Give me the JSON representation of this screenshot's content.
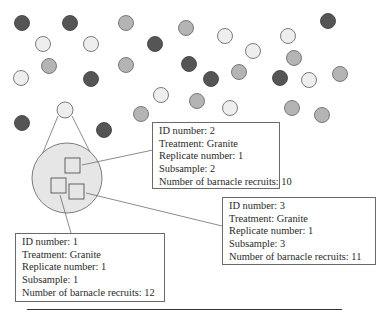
{
  "figure": {
    "colors": {
      "dark": "#555555",
      "mid": "#b4b4b4",
      "light": "#eeeeee",
      "stroke": "#6e6e6e",
      "plot_fill": "#e6e6e6"
    },
    "plots": [
      {
        "x": 22,
        "y": 23,
        "shade": "dark"
      },
      {
        "x": 70,
        "y": 23,
        "shade": "dark"
      },
      {
        "x": 126,
        "y": 23,
        "shade": "mid"
      },
      {
        "x": 186,
        "y": 28,
        "shade": "mid"
      },
      {
        "x": 328,
        "y": 21,
        "shade": "dark"
      },
      {
        "x": 43,
        "y": 44,
        "shade": "light"
      },
      {
        "x": 91,
        "y": 44,
        "shade": "light"
      },
      {
        "x": 155,
        "y": 44,
        "shade": "dark"
      },
      {
        "x": 225,
        "y": 36,
        "shade": "light"
      },
      {
        "x": 288,
        "y": 36,
        "shade": "light"
      },
      {
        "x": 49,
        "y": 66,
        "shade": "mid"
      },
      {
        "x": 126,
        "y": 65,
        "shade": "mid"
      },
      {
        "x": 253,
        "y": 51,
        "shade": "light"
      },
      {
        "x": 294,
        "y": 58,
        "shade": "mid"
      },
      {
        "x": 21,
        "y": 78,
        "shade": "light"
      },
      {
        "x": 91,
        "y": 79,
        "shade": "dark"
      },
      {
        "x": 189,
        "y": 64,
        "shade": "dark"
      },
      {
        "x": 211,
        "y": 79,
        "shade": "dark"
      },
      {
        "x": 239,
        "y": 72,
        "shade": "mid"
      },
      {
        "x": 280,
        "y": 78,
        "shade": "dark"
      },
      {
        "x": 309,
        "y": 80,
        "shade": "light"
      },
      {
        "x": 340,
        "y": 74,
        "shade": "mid"
      },
      {
        "x": 161,
        "y": 95,
        "shade": "light"
      },
      {
        "x": 197,
        "y": 101,
        "shade": "mid"
      },
      {
        "x": 230,
        "y": 108,
        "shade": "light"
      },
      {
        "x": 292,
        "y": 108,
        "shade": "mid"
      },
      {
        "x": 322,
        "y": 115,
        "shade": "mid"
      },
      {
        "x": 22,
        "y": 123,
        "shade": "dark"
      },
      {
        "x": 104,
        "y": 130,
        "shade": "dark"
      },
      {
        "x": 141,
        "y": 114,
        "shade": "mid"
      }
    ],
    "selected_plot": {
      "x": 65,
      "y": 110,
      "shade": "light"
    },
    "magnified_plot": {
      "cx": 67,
      "cy": 178,
      "r": 35
    },
    "subsamples": [
      {
        "id": 2,
        "x": 65,
        "y": 158
      },
      {
        "id": 1,
        "x": 51,
        "y": 178
      },
      {
        "id": 3,
        "x": 69,
        "y": 184
      }
    ],
    "records": [
      {
        "id_line": "ID number: 1",
        "treatment_line": "Treatment: Granite",
        "replicate_line": "Replicate number: 1",
        "subsample_line": "Subsample: 1",
        "recruits_line": "Number of barnacle recruits: 12"
      },
      {
        "id_line": "ID number: 2",
        "treatment_line": "Treatment: Granite",
        "replicate_line": "Replicate number: 1",
        "subsample_line": "Subsample: 2",
        "recruits_line": "Number of barnacle recruits: 10"
      },
      {
        "id_line": "ID number: 3",
        "treatment_line": "Treatment: Granite",
        "replicate_line": "Replicate number: 1",
        "subsample_line": "Subsample: 3",
        "recruits_line": "Number of barnacle recruits: 11"
      }
    ],
    "table_rule": {
      "x1": 27,
      "x2": 342,
      "dividers": [
        88,
        148,
        200,
        257,
        341
      ]
    }
  }
}
